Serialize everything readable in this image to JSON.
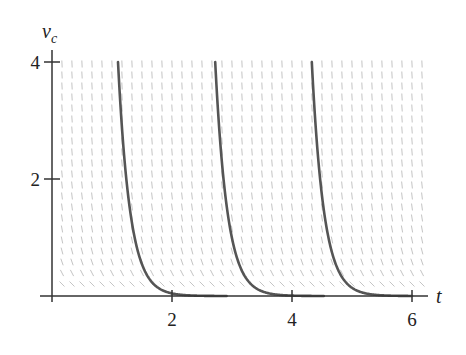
{
  "chart_data": {
    "type": "line",
    "title": "",
    "xlabel": "t",
    "ylabel": "v_c",
    "ylabel_main": "v",
    "ylabel_sub": "c",
    "xlim": [
      0,
      6.25
    ],
    "ylim": [
      0,
      4.2
    ],
    "x_ticks": [
      2,
      4,
      6
    ],
    "x_tick_labels": [
      "2",
      "4",
      "6"
    ],
    "y_ticks": [
      2,
      4
    ],
    "y_tick_labels": [
      "2",
      "4"
    ],
    "grid": false,
    "legend": null,
    "slope_field": {
      "equation": "dv/dt = -k v",
      "k": 5,
      "color": "#c4c4c4"
    },
    "series": [
      {
        "name": "solution-1",
        "model": "v = 4 e^{-5(t - 1.1)}",
        "t0": 1.1,
        "v0": 4,
        "k": 5,
        "points": [
          [
            1.1,
            4.0
          ],
          [
            1.24,
            2.0
          ],
          [
            1.38,
            1.0
          ],
          [
            1.52,
            0.5
          ],
          [
            1.7,
            0.2
          ],
          [
            2.0,
            0.04
          ],
          [
            3.0,
            0.0
          ]
        ]
      },
      {
        "name": "solution-2",
        "model": "v = 4 e^{-5(t - 2.72)}",
        "t0": 2.72,
        "v0": 4,
        "k": 5,
        "points": [
          [
            2.72,
            4.0
          ],
          [
            2.86,
            2.0
          ],
          [
            3.0,
            1.0
          ],
          [
            3.14,
            0.5
          ],
          [
            3.32,
            0.2
          ],
          [
            3.62,
            0.04
          ],
          [
            4.5,
            0.0
          ]
        ]
      },
      {
        "name": "solution-3",
        "model": "v = 4 e^{-5(t - 4.33)}",
        "t0": 4.33,
        "v0": 4,
        "k": 5,
        "points": [
          [
            4.33,
            4.0
          ],
          [
            4.47,
            2.0
          ],
          [
            4.61,
            1.0
          ],
          [
            4.75,
            0.5
          ],
          [
            4.93,
            0.2
          ],
          [
            5.23,
            0.04
          ],
          [
            6.0,
            0.0
          ]
        ]
      }
    ],
    "colors": {
      "curve": "#555555",
      "axis": "#333333",
      "field": "#c4c4c4"
    }
  }
}
